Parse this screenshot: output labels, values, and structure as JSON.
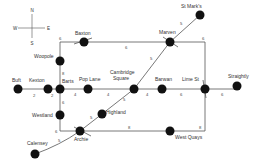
{
  "compass": {
    "n": "N",
    "s": "S",
    "e": "E",
    "w": "W"
  },
  "stations": {
    "buft": "Buft",
    "kexton": "Kexton",
    "barts": "Barts",
    "pop_lane": "Pop Lane",
    "cambridge": "Cambridge",
    "square": "Square",
    "barwan": "Barwan",
    "lime_st": "Lime St",
    "straightly": "Straightly",
    "baxton": "Baxton",
    "marven": "Marven",
    "st_marks": "St Mark's",
    "woopole": "Woopole",
    "westland": "Westland",
    "highland": "Highland",
    "archie": "Archie",
    "calensey": "Calensey",
    "west_quays": "West Quays"
  },
  "weights": {
    "buft_kexton": "2",
    "kexton_barts": "2",
    "barts_pop": "4",
    "pop_cambridge": "4",
    "cambridge_barwan": "4",
    "barwan_lime": "6",
    "lime_straightly": "6",
    "woopole_barts": "8",
    "barts_westland": "6",
    "corner_baxton": "6",
    "baxton_marven": "6",
    "marven_corner": "6",
    "corner_lime": "9",
    "marven_stmarks": "5",
    "marven_cambridge": "5",
    "cambridge_highland": "5",
    "highland_archie": "5",
    "westland_archie": "6",
    "archie_westquays": "8",
    "westquays_lime": "8",
    "archie_calensey": "5"
  }
}
